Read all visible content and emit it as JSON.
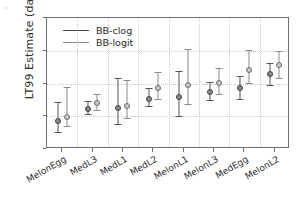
{
  "chart_data": {
    "type": "scatter",
    "title": "",
    "xlabel": "",
    "ylabel": "LT99 Estimate (days)",
    "ylim": [
      0,
      20
    ],
    "yticks": [
      0,
      5,
      10,
      15,
      20
    ],
    "grid": true,
    "legend_position": "top-left",
    "categories": [
      "MelonEgg",
      "MedL3",
      "MedL1",
      "MedL2",
      "MelonL1",
      "MelonL3",
      "MedEgg",
      "MelonL2"
    ],
    "series": [
      {
        "name": "BB-clog",
        "marker": "filled-circle",
        "color": "#8a8a8a",
        "values": [
          4.2,
          6.1,
          6.2,
          7.7,
          8.0,
          8.7,
          9.3,
          11.5
        ],
        "lower": [
          2.6,
          5.3,
          3.8,
          6.6,
          5.1,
          7.5,
          7.6,
          9.7
        ],
        "upper": [
          7.1,
          7.3,
          10.8,
          9.3,
          11.9,
          10.2,
          11.2,
          13.2
        ]
      },
      {
        "name": "BB-logit",
        "marker": "open-circle",
        "color": "#c8c8c8",
        "values": [
          4.9,
          7.0,
          6.6,
          9.3,
          9.7,
          10.0,
          12.1,
          12.8
        ],
        "lower": [
          3.5,
          5.9,
          4.8,
          7.7,
          6.9,
          8.4,
          10.0,
          10.8
        ],
        "upper": [
          9.5,
          8.4,
          10.6,
          11.7,
          15.3,
          12.3,
          15.1,
          15.0
        ]
      }
    ]
  },
  "legend": {
    "entries": [
      {
        "label": "BB-clog"
      },
      {
        "label": "BB-logit"
      }
    ]
  },
  "axes": {
    "y_title": "LT99 Estimate (days)",
    "y_tick_labels": [
      "0",
      "5",
      "10",
      "15",
      "20"
    ],
    "x_tick_labels": [
      "MelonEgg",
      "MedL3",
      "MedL1",
      "MedL2",
      "MelonL1",
      "MelonL3",
      "MedEgg",
      "MelonL2"
    ]
  }
}
